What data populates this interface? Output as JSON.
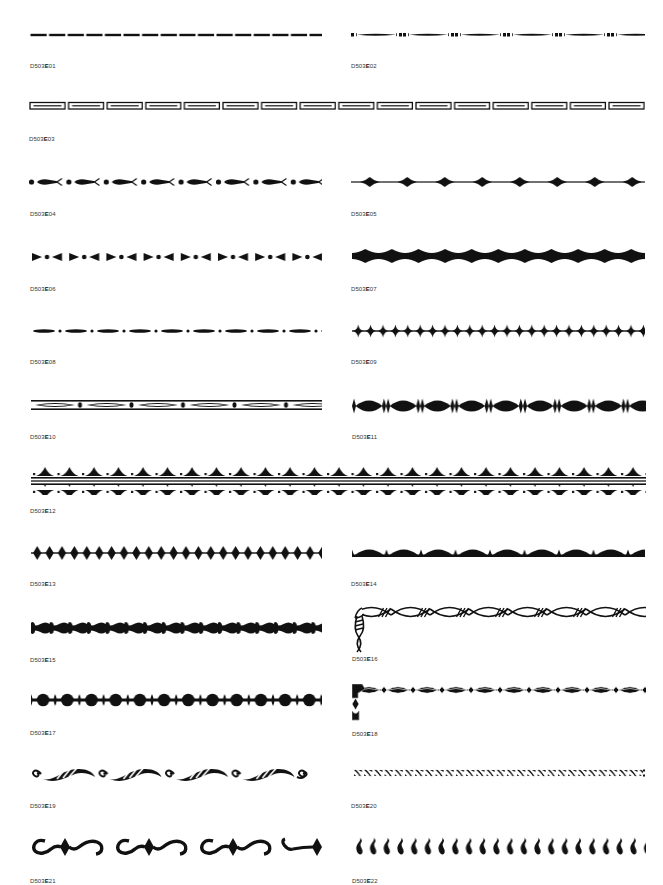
{
  "catalog": {
    "ink_color": "#111111",
    "background": "#ffffff",
    "items": [
      {
        "code": "D503E01",
        "prefix": "D503",
        "letter": "E",
        "number": "01",
        "pattern": "dashes"
      },
      {
        "code": "D503E02",
        "prefix": "D503",
        "letter": "E",
        "number": "02",
        "pattern": "tapered-bars-with-squares"
      },
      {
        "code": "D503E03",
        "prefix": "D503",
        "letter": "E",
        "number": "03",
        "pattern": "outlined-rectangles"
      },
      {
        "code": "D503E04",
        "prefix": "D503",
        "letter": "E",
        "number": "04",
        "pattern": "fish-and-dots"
      },
      {
        "code": "D503E05",
        "prefix": "D503",
        "letter": "E",
        "number": "05",
        "pattern": "diamonds-on-line"
      },
      {
        "code": "D503E06",
        "prefix": "D503",
        "letter": "E",
        "number": "06",
        "pattern": "arrows-and-dots"
      },
      {
        "code": "D503E07",
        "prefix": "D503",
        "letter": "E",
        "number": "07",
        "pattern": "bold-diamond-chain"
      },
      {
        "code": "D503E08",
        "prefix": "D503",
        "letter": "E",
        "number": "08",
        "pattern": "ovals-and-dots"
      },
      {
        "code": "D503E09",
        "prefix": "D503",
        "letter": "E",
        "number": "09",
        "pattern": "star-diamonds"
      },
      {
        "code": "D503E10",
        "prefix": "D503",
        "letter": "E",
        "number": "10",
        "pattern": "banded-ovals"
      },
      {
        "code": "D503E11",
        "prefix": "D503",
        "letter": "E",
        "number": "11",
        "pattern": "lens-chain"
      },
      {
        "code": "D503E12",
        "prefix": "D503",
        "letter": "E",
        "number": "12",
        "pattern": "double-crest-band"
      },
      {
        "code": "D503E13",
        "prefix": "D503",
        "letter": "E",
        "number": "13",
        "pattern": "diamond-row"
      },
      {
        "code": "D503E14",
        "prefix": "D503",
        "letter": "E",
        "number": "14",
        "pattern": "scallop-arches"
      },
      {
        "code": "D503E15",
        "prefix": "D503",
        "letter": "E",
        "number": "15",
        "pattern": "bead-chain"
      },
      {
        "code": "D503E16",
        "prefix": "D503",
        "letter": "E",
        "number": "16",
        "pattern": "twisted-rope-corner"
      },
      {
        "code": "D503E17",
        "prefix": "D503",
        "letter": "E",
        "number": "17",
        "pattern": "pearl-chain"
      },
      {
        "code": "D503E18",
        "prefix": "D503",
        "letter": "E",
        "number": "18",
        "pattern": "jeweled-oval-corner"
      },
      {
        "code": "D503E19",
        "prefix": "D503",
        "letter": "E",
        "number": "19",
        "pattern": "scroll-waves"
      },
      {
        "code": "D503E20",
        "prefix": "D503",
        "letter": "E",
        "number": "20",
        "pattern": "diagonal-links"
      },
      {
        "code": "D503E21",
        "prefix": "D503",
        "letter": "E",
        "number": "21",
        "pattern": "scroll-and-diamond"
      },
      {
        "code": "D503E22",
        "prefix": "D503",
        "letter": "E",
        "number": "22",
        "pattern": "flame-drops"
      }
    ]
  }
}
